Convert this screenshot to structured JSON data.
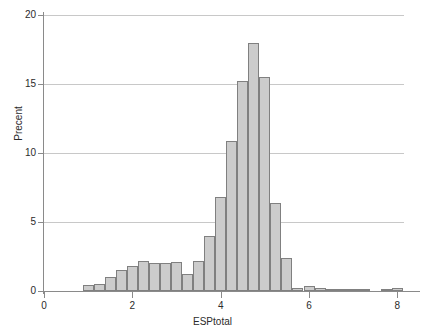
{
  "chart_data": {
    "type": "bar",
    "title": "",
    "subtitle": "",
    "xlabel": "ESPtotal",
    "ylabel": "Precent",
    "xlim": [
      0,
      8.15
    ],
    "ylim": [
      0,
      20
    ],
    "grid": true,
    "legend": null,
    "bin_width": 0.25,
    "xticks": [
      0,
      2,
      4,
      6,
      8
    ],
    "xtick_labels": [
      "0",
      "2",
      "4",
      "6",
      "8"
    ],
    "yticks": [
      0,
      5,
      10,
      15,
      20
    ],
    "ytick_labels": [
      "0",
      "5",
      "10",
      "15",
      "20"
    ],
    "bar_fill": "#cccccc",
    "bar_edge": "#808080",
    "grid_color": "#c8c8c8",
    "axis_color": "#8a8a8a",
    "bins": [
      {
        "x0": 0.875,
        "x1": 1.125,
        "value": 0.4
      },
      {
        "x0": 1.125,
        "x1": 1.375,
        "value": 0.5
      },
      {
        "x0": 1.375,
        "x1": 1.625,
        "value": 1.0
      },
      {
        "x0": 1.625,
        "x1": 1.875,
        "value": 1.5
      },
      {
        "x0": 1.875,
        "x1": 2.125,
        "value": 1.8
      },
      {
        "x0": 2.125,
        "x1": 2.375,
        "value": 2.2
      },
      {
        "x0": 2.375,
        "x1": 2.625,
        "value": 2.0
      },
      {
        "x0": 2.625,
        "x1": 2.875,
        "value": 2.0
      },
      {
        "x0": 2.875,
        "x1": 3.125,
        "value": 2.1
      },
      {
        "x0": 3.125,
        "x1": 3.375,
        "value": 1.2
      },
      {
        "x0": 3.375,
        "x1": 3.625,
        "value": 2.2
      },
      {
        "x0": 3.625,
        "x1": 3.875,
        "value": 4.0
      },
      {
        "x0": 3.875,
        "x1": 4.125,
        "value": 6.8
      },
      {
        "x0": 4.125,
        "x1": 4.375,
        "value": 10.9
      },
      {
        "x0": 4.375,
        "x1": 4.625,
        "value": 15.2
      },
      {
        "x0": 4.625,
        "x1": 4.875,
        "value": 18.0
      },
      {
        "x0": 4.875,
        "x1": 5.125,
        "value": 15.5
      },
      {
        "x0": 5.125,
        "x1": 5.375,
        "value": 6.4
      },
      {
        "x0": 5.375,
        "x1": 5.625,
        "value": 2.4
      },
      {
        "x0": 5.625,
        "x1": 5.875,
        "value": 0.25
      },
      {
        "x0": 5.875,
        "x1": 6.125,
        "value": 0.35
      },
      {
        "x0": 6.125,
        "x1": 6.375,
        "value": 0.2
      },
      {
        "x0": 6.375,
        "x1": 6.625,
        "value": 0.15
      },
      {
        "x0": 6.625,
        "x1": 6.875,
        "value": 0.05
      },
      {
        "x0": 6.875,
        "x1": 7.125,
        "value": 0.05
      },
      {
        "x0": 7.125,
        "x1": 7.375,
        "value": 0.05
      },
      {
        "x0": 7.625,
        "x1": 7.875,
        "value": 0.1
      },
      {
        "x0": 7.875,
        "x1": 8.125,
        "value": 0.2
      }
    ]
  }
}
